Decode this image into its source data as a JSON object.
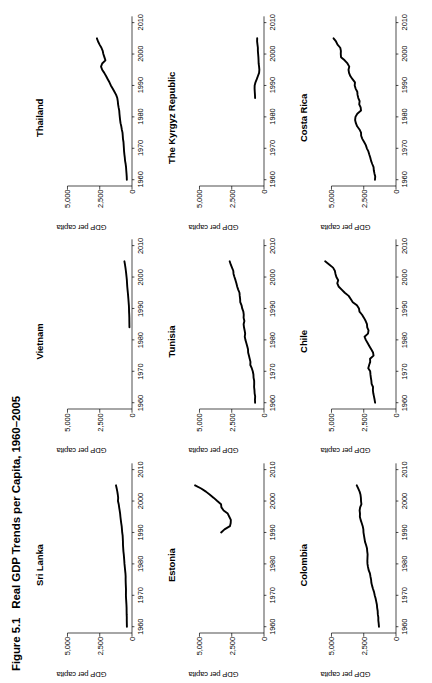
{
  "caption": {
    "number": "Figure 5.1",
    "title": "Real GDP Trends per Capita, 1960–2005"
  },
  "axes": {
    "ylabel": "GDP per capita",
    "ytick_labels": [
      "0",
      "2,500",
      "5,000"
    ],
    "ytick_values": [
      0,
      2500,
      5000
    ],
    "xtick_labels": [
      "1960",
      "1970",
      "1980",
      "1990",
      "2000",
      "2010"
    ],
    "xtick_values": [
      1960,
      1970,
      1980,
      1990,
      2000,
      2010
    ],
    "ylim": [
      0,
      6200
    ],
    "xlim": [
      1958,
      2012
    ],
    "line_color": "#000000"
  },
  "chart_data": [
    {
      "type": "line",
      "title": "Sri Lanka",
      "xlabel": "",
      "ylabel": "GDP per capita",
      "xlim": [
        1958,
        2012
      ],
      "ylim": [
        0,
        6200
      ],
      "grid": false,
      "legend": "none",
      "x": [
        1960,
        1961,
        1962,
        1963,
        1964,
        1965,
        1966,
        1967,
        1968,
        1969,
        1970,
        1971,
        1972,
        1973,
        1974,
        1975,
        1976,
        1977,
        1978,
        1979,
        1980,
        1981,
        1982,
        1983,
        1984,
        1985,
        1986,
        1987,
        1988,
        1989,
        1990,
        1991,
        1992,
        1993,
        1994,
        1995,
        1996,
        1997,
        1998,
        1999,
        2000,
        2001,
        2002,
        2003,
        2004,
        2005
      ],
      "values": [
        395,
        400,
        405,
        404,
        414,
        418,
        420,
        430,
        445,
        460,
        472,
        468,
        466,
        478,
        488,
        494,
        492,
        508,
        535,
        558,
        582,
        598,
        617,
        638,
        665,
        682,
        698,
        702,
        712,
        725,
        760,
        778,
        800,
        836,
        868,
        898,
        920,
        958,
        996,
        1030,
        1088,
        1072,
        1100,
        1138,
        1186,
        1240
      ]
    },
    {
      "type": "line",
      "title": "Vietnam",
      "xlabel": "",
      "ylabel": "GDP per capita",
      "xlim": [
        1958,
        2012
      ],
      "ylim": [
        0,
        6200
      ],
      "grid": false,
      "legend": "none",
      "x": [
        1984,
        1985,
        1986,
        1987,
        1988,
        1989,
        1990,
        1991,
        1992,
        1993,
        1994,
        1995,
        1996,
        1997,
        1998,
        1999,
        2000,
        2001,
        2002,
        2003,
        2004,
        2005
      ],
      "values": [
        198,
        202,
        206,
        208,
        216,
        228,
        232,
        242,
        262,
        280,
        300,
        322,
        346,
        368,
        384,
        398,
        422,
        448,
        476,
        508,
        546,
        588
      ]
    },
    {
      "type": "line",
      "title": "Thailand",
      "xlabel": "",
      "ylabel": "GDP per capita",
      "xlim": [
        1958,
        2012
      ],
      "ylim": [
        0,
        6200
      ],
      "grid": false,
      "legend": "none",
      "x": [
        1960,
        1961,
        1962,
        1963,
        1964,
        1965,
        1966,
        1967,
        1968,
        1969,
        1970,
        1971,
        1972,
        1973,
        1974,
        1975,
        1976,
        1977,
        1978,
        1979,
        1980,
        1981,
        1982,
        1983,
        1984,
        1985,
        1986,
        1987,
        1988,
        1989,
        1990,
        1991,
        1992,
        1993,
        1994,
        1995,
        1996,
        1997,
        1998,
        1999,
        2000,
        2001,
        2002,
        2003,
        2004,
        2005
      ],
      "values": [
        400,
        408,
        426,
        446,
        462,
        492,
        536,
        558,
        588,
        614,
        628,
        644,
        660,
        700,
        716,
        736,
        790,
        830,
        888,
        920,
        948,
        972,
        990,
        1038,
        1078,
        1102,
        1140,
        1230,
        1360,
        1500,
        1640,
        1748,
        1880,
        2010,
        2150,
        2310,
        2400,
        2310,
        2060,
        2140,
        2220,
        2270,
        2370,
        2510,
        2630,
        2720
      ]
    },
    {
      "type": "line",
      "title": "Estonia",
      "xlabel": "",
      "ylabel": "GDP per capita",
      "xlim": [
        1958,
        2012
      ],
      "ylim": [
        0,
        6200
      ],
      "grid": false,
      "legend": "none",
      "x": [
        1990,
        1991,
        1992,
        1993,
        1994,
        1995,
        1996,
        1997,
        1998,
        1999,
        2000,
        2001,
        2002,
        2003,
        2004,
        2005
      ],
      "values": [
        3320,
        3060,
        2640,
        2580,
        2570,
        2690,
        2810,
        3130,
        3300,
        3330,
        3620,
        3890,
        4190,
        4500,
        4870,
        5340
      ]
    },
    {
      "type": "line",
      "title": "Tunisia",
      "xlabel": "",
      "ylabel": "GDP per capita",
      "xlim": [
        1958,
        2012
      ],
      "ylim": [
        0,
        6200
      ],
      "grid": false,
      "legend": "none",
      "x": [
        1960,
        1961,
        1962,
        1963,
        1964,
        1965,
        1966,
        1967,
        1968,
        1969,
        1970,
        1971,
        1972,
        1973,
        1974,
        1975,
        1976,
        1977,
        1978,
        1979,
        1980,
        1981,
        1982,
        1983,
        1984,
        1985,
        1986,
        1987,
        1988,
        1989,
        1990,
        1991,
        1992,
        1993,
        1994,
        1995,
        1996,
        1997,
        1998,
        1999,
        2000,
        2001,
        2002,
        2003,
        2004,
        2005
      ],
      "values": [
        690,
        700,
        686,
        726,
        740,
        768,
        760,
        762,
        810,
        820,
        872,
        948,
        1060,
        1050,
        1110,
        1170,
        1230,
        1240,
        1300,
        1370,
        1440,
        1490,
        1460,
        1500,
        1550,
        1580,
        1520,
        1580,
        1570,
        1600,
        1690,
        1740,
        1840,
        1850,
        1880,
        1900,
        2000,
        2080,
        2140,
        2210,
        2290,
        2360,
        2380,
        2480,
        2580,
        2660
      ]
    },
    {
      "type": "line",
      "title": "The Kyrgyz Republic",
      "xlabel": "",
      "ylabel": "GDP per capita",
      "xlim": [
        1958,
        2012
      ],
      "ylim": [
        0,
        6200
      ],
      "grid": false,
      "legend": "none",
      "x": [
        1986,
        1987,
        1988,
        1989,
        1990,
        1991,
        1992,
        1993,
        1994,
        1995,
        1996,
        1997,
        1998,
        1999,
        2000,
        2001,
        2002,
        2003,
        2004,
        2005
      ],
      "values": [
        690,
        700,
        716,
        730,
        724,
        660,
        560,
        470,
        380,
        360,
        382,
        415,
        423,
        435,
        455,
        475,
        475,
        505,
        535,
        528
      ]
    },
    {
      "type": "line",
      "title": "Colombia",
      "xlabel": "",
      "ylabel": "GDP per capita",
      "xlim": [
        1958,
        2012
      ],
      "ylim": [
        0,
        6200
      ],
      "grid": false,
      "legend": "none",
      "x": [
        1960,
        1961,
        1962,
        1963,
        1964,
        1965,
        1966,
        1967,
        1968,
        1969,
        1970,
        1971,
        1972,
        1973,
        1974,
        1975,
        1976,
        1977,
        1978,
        1979,
        1980,
        1981,
        1982,
        1983,
        1984,
        1985,
        1986,
        1987,
        1988,
        1989,
        1990,
        1991,
        1992,
        1993,
        1994,
        1995,
        1996,
        1997,
        1998,
        1999,
        2000,
        2001,
        2002,
        2003,
        2004,
        2005
      ],
      "values": [
        1320,
        1340,
        1370,
        1370,
        1410,
        1420,
        1460,
        1480,
        1530,
        1580,
        1650,
        1700,
        1780,
        1850,
        1910,
        1930,
        1980,
        2020,
        2120,
        2170,
        2210,
        2220,
        2210,
        2200,
        2230,
        2250,
        2320,
        2400,
        2440,
        2480,
        2520,
        2530,
        2580,
        2660,
        2740,
        2800,
        2790,
        2820,
        2780,
        2680,
        2710,
        2720,
        2750,
        2820,
        2930,
        3040
      ]
    },
    {
      "type": "line",
      "title": "Chile",
      "xlabel": "",
      "ylabel": "GDP per capita",
      "xlim": [
        1958,
        2012
      ],
      "ylim": [
        0,
        6200
      ],
      "grid": false,
      "legend": "none",
      "x": [
        1960,
        1961,
        1962,
        1963,
        1964,
        1965,
        1966,
        1967,
        1968,
        1969,
        1970,
        1971,
        1972,
        1973,
        1974,
        1975,
        1976,
        1977,
        1978,
        1979,
        1980,
        1981,
        1982,
        1983,
        1984,
        1985,
        1986,
        1987,
        1988,
        1989,
        1990,
        1991,
        1992,
        1993,
        1994,
        1995,
        1996,
        1997,
        1998,
        1999,
        2000,
        2001,
        2002,
        2003,
        2004,
        2005
      ],
      "values": [
        1620,
        1660,
        1710,
        1760,
        1790,
        1780,
        1890,
        1910,
        1950,
        1980,
        2000,
        2150,
        2080,
        2000,
        2010,
        1740,
        1780,
        1920,
        2060,
        2200,
        2340,
        2440,
        2170,
        2130,
        2230,
        2250,
        2350,
        2480,
        2630,
        2830,
        2870,
        3030,
        3350,
        3510,
        3670,
        3970,
        4210,
        4450,
        4550,
        4480,
        4620,
        4690,
        4740,
        4880,
        5180,
        5490
      ]
    },
    {
      "type": "line",
      "title": "Costa Rica",
      "xlabel": "",
      "ylabel": "GDP per capita",
      "xlim": [
        1958,
        2012
      ],
      "ylim": [
        0,
        6200
      ],
      "grid": false,
      "legend": "none",
      "x": [
        1960,
        1961,
        1962,
        1963,
        1964,
        1965,
        1966,
        1967,
        1968,
        1969,
        1970,
        1971,
        1972,
        1973,
        1974,
        1975,
        1976,
        1977,
        1978,
        1979,
        1980,
        1981,
        1982,
        1983,
        1984,
        1985,
        1986,
        1987,
        1988,
        1989,
        1990,
        1991,
        1992,
        1993,
        1994,
        1995,
        1996,
        1997,
        1998,
        1999,
        2000,
        2001,
        2002,
        2003,
        2004,
        2005
      ],
      "values": [
        1630,
        1610,
        1670,
        1720,
        1740,
        1840,
        1930,
        1990,
        2070,
        2140,
        2260,
        2340,
        2470,
        2610,
        2700,
        2710,
        2830,
        3010,
        3110,
        3170,
        3140,
        3000,
        2710,
        2740,
        2850,
        2820,
        2920,
        2980,
        3000,
        3130,
        3200,
        3180,
        3370,
        3540,
        3640,
        3680,
        3620,
        3760,
        3980,
        4260,
        4280,
        4270,
        4320,
        4530,
        4650,
        4840
      ]
    }
  ]
}
